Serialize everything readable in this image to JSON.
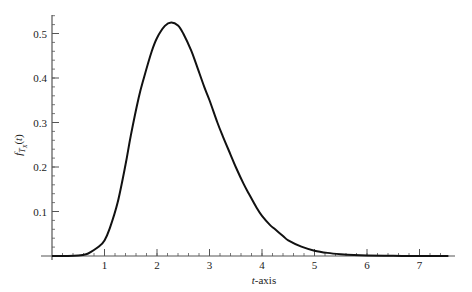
{
  "chart_data": {
    "type": "line",
    "title": "",
    "xlabel": "t-axis",
    "xlabel_italic_part": "t",
    "xlabel_rest": "-axis",
    "ylabel": "f_{T_X}(t)",
    "xlim": [
      0,
      7.6
    ],
    "ylim": [
      0,
      0.54
    ],
    "x_ticks": [
      1,
      2,
      3,
      4,
      5,
      6,
      7
    ],
    "x_tick_labels": [
      "1",
      "2",
      "3",
      "4",
      "5",
      "6",
      "7"
    ],
    "x_minor_step": 0.2,
    "y_ticks": [
      0.1,
      0.2,
      0.3,
      0.4,
      0.5
    ],
    "y_tick_labels": [
      "0.1",
      "0.2",
      "0.3",
      "0.4",
      "0.5"
    ],
    "y_minor_step": 0.02,
    "grid": false,
    "legend": null,
    "series": [
      {
        "name": "f_{T_X}(t)",
        "color": "#111111",
        "x": [
          0,
          0.3,
          0.5,
          0.65,
          0.75,
          0.9,
          1.0,
          1.1,
          1.25,
          1.4,
          1.5,
          1.65,
          1.75,
          1.9,
          2.0,
          2.15,
          2.27,
          2.4,
          2.5,
          2.65,
          2.75,
          2.9,
          3.0,
          3.15,
          3.25,
          3.4,
          3.5,
          3.65,
          3.75,
          3.9,
          4.0,
          4.15,
          4.25,
          4.4,
          4.5,
          4.75,
          5.0,
          5.25,
          5.5,
          5.75,
          6.0,
          6.5,
          7.0,
          7.55
        ],
        "values": [
          0,
          0,
          0.001,
          0.004,
          0.01,
          0.022,
          0.035,
          0.062,
          0.12,
          0.205,
          0.27,
          0.355,
          0.4,
          0.46,
          0.49,
          0.517,
          0.525,
          0.518,
          0.5,
          0.462,
          0.43,
          0.38,
          0.35,
          0.3,
          0.27,
          0.228,
          0.2,
          0.162,
          0.14,
          0.108,
          0.09,
          0.07,
          0.06,
          0.045,
          0.035,
          0.021,
          0.012,
          0.007,
          0.004,
          0.002,
          0.001,
          0.0003,
          0,
          0
        ]
      }
    ]
  }
}
